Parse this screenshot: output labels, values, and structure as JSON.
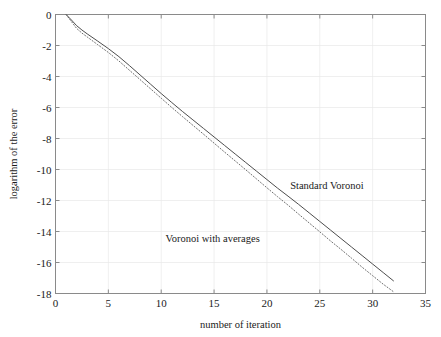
{
  "figure": {
    "background": "#ffffff",
    "frame_color": "#8a8a8a",
    "grid_color": "#e8e8e8"
  },
  "chart_data": {
    "type": "line",
    "title": "",
    "xlabel": "number of iteration",
    "ylabel": "logarithm of the error",
    "xlim": [
      0,
      35
    ],
    "ylim": [
      -18,
      0
    ],
    "xticks": [
      0,
      5,
      10,
      15,
      20,
      25,
      30,
      35
    ],
    "yticks": [
      0,
      -2,
      -4,
      -6,
      -8,
      -10,
      -12,
      -14,
      -16,
      -18
    ],
    "xtick_labels": [
      "0",
      "5",
      "10",
      "15",
      "20",
      "25",
      "30",
      "35"
    ],
    "ytick_labels": [
      "0",
      "-2",
      "-4",
      "-6",
      "-8",
      "-10",
      "-12",
      "-14",
      "-16",
      "-18"
    ],
    "grid": true,
    "legend": "annotations",
    "series": [
      {
        "name": "Standard Voronoi",
        "style": "solid",
        "color": "#4d4d4d",
        "x": [
          1,
          1.5,
          2,
          2.5,
          3,
          4,
          5,
          6,
          7,
          8,
          9,
          10,
          11,
          12,
          13,
          14,
          15,
          16,
          17,
          18,
          19,
          20,
          21,
          22,
          23,
          24,
          25,
          26,
          27,
          28,
          29,
          30,
          31,
          32
        ],
        "y": [
          0.0,
          -0.35,
          -0.72,
          -1.0,
          -1.25,
          -1.72,
          -2.2,
          -2.72,
          -3.3,
          -3.9,
          -4.5,
          -5.1,
          -5.68,
          -6.25,
          -6.8,
          -7.35,
          -7.9,
          -8.45,
          -9.0,
          -9.55,
          -10.1,
          -10.65,
          -11.2,
          -11.72,
          -12.25,
          -12.8,
          -13.35,
          -13.9,
          -14.45,
          -15.0,
          -15.55,
          -16.1,
          -16.65,
          -17.2
        ]
      },
      {
        "name": "Voronoi with averages",
        "style": "dotted",
        "color": "#6e6e6e",
        "x": [
          1,
          1.5,
          2,
          2.5,
          3,
          4,
          5,
          6,
          7,
          8,
          9,
          10,
          11,
          12,
          13,
          14,
          15,
          16,
          17,
          18,
          19,
          20,
          21,
          22,
          23,
          24,
          25,
          26,
          27,
          28,
          29,
          30,
          31,
          32
        ],
        "y": [
          0.0,
          -0.45,
          -0.9,
          -1.2,
          -1.45,
          -1.95,
          -2.45,
          -3.0,
          -3.6,
          -4.2,
          -4.8,
          -5.4,
          -6.0,
          -6.58,
          -7.15,
          -7.72,
          -8.3,
          -8.88,
          -9.45,
          -10.02,
          -10.6,
          -11.18,
          -11.75,
          -12.3,
          -12.88,
          -13.45,
          -14.02,
          -14.6,
          -15.15,
          -15.72,
          -16.3,
          -16.85,
          -17.4,
          -17.9
        ]
      }
    ],
    "annotations": [
      {
        "text": "Standard Voronoi",
        "x": 22.2,
        "y": -11.25
      },
      {
        "text": "Voronoi with averages",
        "x": 10.4,
        "y": -14.7
      }
    ]
  }
}
